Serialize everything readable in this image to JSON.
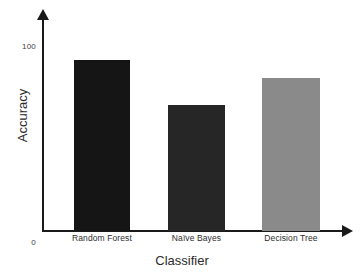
{
  "chart_data": {
    "type": "bar",
    "title": "",
    "xlabel": "Classifier",
    "ylabel": "Accuracy",
    "categories": [
      "Random Forest",
      "Naïve Bayes",
      "Decision Tree"
    ],
    "values": [
      95,
      70,
      85
    ],
    "series": [
      {
        "name": "Accuracy",
        "values": [
          95,
          70,
          85
        ]
      }
    ],
    "ylim": [
      0,
      100
    ],
    "ytick_labels": [
      "0",
      "100"
    ],
    "ytick_values": [
      0,
      100
    ],
    "grid": false,
    "legend": false,
    "bar_colors": [
      "#151515",
      "#262626",
      "#8a8a8a"
    ],
    "axis_color": "#1a1a1a",
    "background_color": "#ffffff",
    "axis_arrows": {
      "y_axis_arrow": "up-arrow-icon",
      "x_axis_arrow": "right-arrow-icon"
    }
  }
}
